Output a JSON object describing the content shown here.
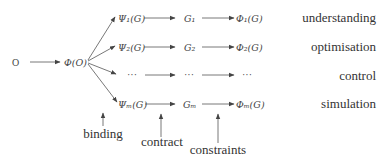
{
  "diagram": {
    "source": {
      "label": "O"
    },
    "mapping": {
      "label": "Φ(O)"
    },
    "rows": [
      {
        "psi": "Ψ₁(G)",
        "g": "G₁",
        "phi": "Φ₁(G)",
        "purpose": "understanding",
        "y": 19
      },
      {
        "psi": "Ψ₂(G)",
        "g": "G₂",
        "phi": "Φ₂(G)",
        "purpose": "optimisation",
        "y": 48
      },
      {
        "psi": "···",
        "g": "···",
        "phi": "···",
        "purpose": "control",
        "y": 77
      },
      {
        "psi": "Ψₘ(G)",
        "g": "Gₘ",
        "phi": "Φₘ(G)",
        "purpose": "simulation",
        "y": 105
      }
    ],
    "annotations": [
      {
        "label": "binding",
        "x": 103
      },
      {
        "label": "contract",
        "x": 160
      },
      {
        "label": "constraints",
        "x": 218
      }
    ]
  },
  "colors": {
    "ink": "#444444",
    "arrow": "#555555"
  }
}
